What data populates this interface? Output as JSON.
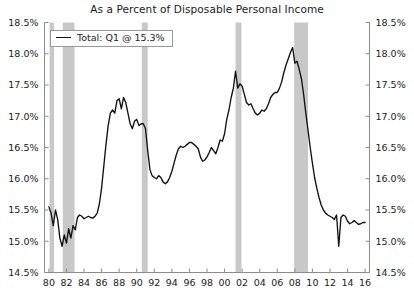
{
  "chart_data": {
    "type": "line",
    "title": "As a Percent of Disposable Personal Income",
    "xlabel": "",
    "ylabel": "",
    "ylim": [
      14.5,
      18.5
    ],
    "xlim": [
      1979.5,
      2016.5
    ],
    "y_tick_labels": [
      "18.5%",
      "18.0%",
      "17.5%",
      "17.0%",
      "16.5%",
      "16.0%",
      "15.5%",
      "15.0%",
      "14.5%"
    ],
    "y_tick_values": [
      18.5,
      18.0,
      17.5,
      17.0,
      16.5,
      16.0,
      15.5,
      15.0,
      14.5
    ],
    "x_tick_labels": [
      "80",
      "82",
      "84",
      "86",
      "88",
      "90",
      "92",
      "94",
      "96",
      "98",
      "00",
      "02",
      "04",
      "06",
      "08",
      "10",
      "12",
      "14",
      "16"
    ],
    "x_tick_values": [
      1980,
      1982,
      1984,
      1986,
      1988,
      1990,
      1992,
      1994,
      1996,
      1998,
      2000,
      2002,
      2004,
      2006,
      2008,
      2010,
      2012,
      2014,
      2016
    ],
    "grid": false,
    "dual_y_axis": true,
    "legend_position": "top-left",
    "line_color": "#111111",
    "recession_band_color": "#c8c8c8",
    "legend": [
      {
        "label": "Total: Q1 @ 15.3%",
        "color": "#111111"
      }
    ],
    "recession_bands": [
      {
        "start": 1980.08,
        "end": 1980.58
      },
      {
        "start": 1981.58,
        "end": 1982.92
      },
      {
        "start": 1990.58,
        "end": 1991.25
      },
      {
        "start": 2001.25,
        "end": 2001.92
      },
      {
        "start": 2007.92,
        "end": 2009.5
      }
    ],
    "series": [
      {
        "name": "Total",
        "color": "#111111",
        "x": [
          1980.0,
          1980.25,
          1980.5,
          1980.75,
          1981.0,
          1981.25,
          1981.5,
          1981.75,
          1982.0,
          1982.25,
          1982.5,
          1982.75,
          1983.0,
          1983.25,
          1983.5,
          1983.75,
          1984.0,
          1984.25,
          1984.5,
          1984.75,
          1985.0,
          1985.25,
          1985.5,
          1985.75,
          1986.0,
          1986.25,
          1986.5,
          1986.75,
          1987.0,
          1987.25,
          1987.5,
          1987.75,
          1988.0,
          1988.25,
          1988.5,
          1988.75,
          1989.0,
          1989.25,
          1989.5,
          1989.75,
          1990.0,
          1990.25,
          1990.5,
          1990.75,
          1991.0,
          1991.25,
          1991.5,
          1991.75,
          1992.0,
          1992.25,
          1992.5,
          1992.75,
          1993.0,
          1993.25,
          1993.5,
          1993.75,
          1994.0,
          1994.25,
          1994.5,
          1994.75,
          1995.0,
          1995.25,
          1995.5,
          1995.75,
          1996.0,
          1996.25,
          1996.5,
          1996.75,
          1997.0,
          1997.25,
          1997.5,
          1997.75,
          1998.0,
          1998.25,
          1998.5,
          1998.75,
          1999.0,
          1999.25,
          1999.5,
          1999.75,
          2000.0,
          2000.25,
          2000.5,
          2000.75,
          2001.0,
          2001.25,
          2001.5,
          2001.75,
          2002.0,
          2002.25,
          2002.5,
          2002.75,
          2003.0,
          2003.25,
          2003.5,
          2003.75,
          2004.0,
          2004.25,
          2004.5,
          2004.75,
          2005.0,
          2005.25,
          2005.5,
          2005.75,
          2006.0,
          2006.25,
          2006.5,
          2006.75,
          2007.0,
          2007.25,
          2007.5,
          2007.75,
          2008.0,
          2008.25,
          2008.5,
          2008.75,
          2009.0,
          2009.25,
          2009.5,
          2009.75,
          2010.0,
          2010.25,
          2010.5,
          2010.75,
          2011.0,
          2011.25,
          2011.5,
          2011.75,
          2012.0,
          2012.25,
          2012.5,
          2012.75,
          2013.0,
          2013.25,
          2013.5,
          2013.75,
          2014.0,
          2014.25,
          2014.5,
          2014.75,
          2015.0,
          2015.25,
          2015.5,
          2015.75,
          2016.0
        ],
        "y": [
          15.55,
          15.45,
          15.25,
          15.5,
          15.35,
          15.05,
          14.92,
          15.1,
          14.97,
          15.2,
          15.05,
          15.25,
          15.18,
          15.38,
          15.42,
          15.4,
          15.36,
          15.38,
          15.4,
          15.38,
          15.37,
          15.4,
          15.45,
          15.6,
          15.85,
          16.2,
          16.55,
          16.85,
          17.05,
          17.1,
          17.05,
          17.25,
          17.28,
          17.12,
          17.3,
          17.22,
          17.05,
          16.88,
          16.8,
          16.92,
          16.95,
          16.85,
          16.88,
          16.88,
          16.8,
          16.45,
          16.15,
          16.05,
          16.02,
          16.0,
          16.05,
          16.02,
          15.95,
          15.92,
          15.95,
          16.02,
          16.12,
          16.25,
          16.38,
          16.48,
          16.52,
          16.5,
          16.52,
          16.55,
          16.58,
          16.58,
          16.55,
          16.52,
          16.48,
          16.35,
          16.28,
          16.3,
          16.35,
          16.42,
          16.5,
          16.45,
          16.4,
          16.5,
          16.62,
          16.6,
          16.72,
          16.95,
          17.1,
          17.3,
          17.45,
          17.72,
          17.45,
          17.52,
          17.48,
          17.35,
          17.22,
          17.18,
          17.2,
          17.12,
          17.05,
          17.02,
          17.05,
          17.1,
          17.08,
          17.12,
          17.2,
          17.3,
          17.35,
          17.38,
          17.38,
          17.45,
          17.55,
          17.7,
          17.82,
          17.92,
          18.02,
          18.1,
          17.85,
          17.88,
          17.75,
          17.6,
          17.35,
          17.05,
          16.78,
          16.5,
          16.25,
          16.02,
          15.85,
          15.7,
          15.58,
          15.5,
          15.45,
          15.42,
          15.4,
          15.38,
          15.35,
          15.42,
          14.92,
          15.38,
          15.42,
          15.4,
          15.32,
          15.28,
          15.3,
          15.33,
          15.3,
          15.27,
          15.28,
          15.3,
          15.3
        ]
      }
    ]
  }
}
